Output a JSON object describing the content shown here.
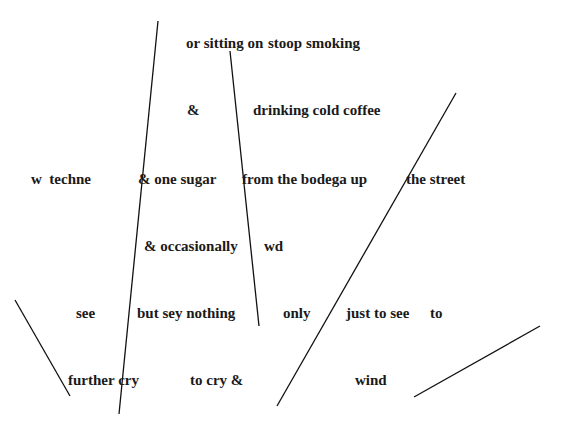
{
  "poem": {
    "fragments": [
      {
        "text": "or sitting on",
        "x": 186,
        "y": 34
      },
      {
        "text": "stoop smoking",
        "x": 268,
        "y": 34
      },
      {
        "text": "&",
        "x": 187,
        "y": 101
      },
      {
        "text": "drinking cold coffee",
        "x": 253,
        "y": 101
      },
      {
        "text": "w  techne",
        "x": 31,
        "y": 170
      },
      {
        "text": "& one sugar",
        "x": 138,
        "y": 170
      },
      {
        "text": "from the bodega up",
        "x": 242,
        "y": 170
      },
      {
        "text": "the street",
        "x": 406,
        "y": 170
      },
      {
        "text": "& occasionally",
        "x": 144,
        "y": 237
      },
      {
        "text": "wd",
        "x": 264,
        "y": 237
      },
      {
        "text": "see",
        "x": 76,
        "y": 304
      },
      {
        "text": "but sey nothing",
        "x": 137,
        "y": 304
      },
      {
        "text": "only",
        "x": 283,
        "y": 304
      },
      {
        "text": "just to see",
        "x": 346,
        "y": 304
      },
      {
        "text": "to",
        "x": 430,
        "y": 304
      },
      {
        "text": "further cry",
        "x": 68,
        "y": 371
      },
      {
        "text": "to cry &",
        "x": 190,
        "y": 371
      },
      {
        "text": "wind",
        "x": 355,
        "y": 371
      }
    ],
    "strokes": [
      {
        "x1": 158,
        "y1": 21,
        "x2": 119,
        "y2": 414
      },
      {
        "x1": 230,
        "y1": 51,
        "x2": 259,
        "y2": 326
      },
      {
        "x1": 456,
        "y1": 93,
        "x2": 277,
        "y2": 406
      },
      {
        "x1": 15,
        "y1": 300,
        "x2": 70,
        "y2": 396
      },
      {
        "x1": 540,
        "y1": 326,
        "x2": 414,
        "y2": 397
      }
    ],
    "stroke_color": "#111111"
  }
}
